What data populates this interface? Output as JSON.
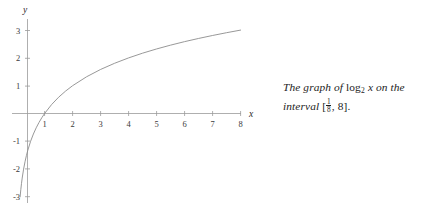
{
  "chart_data": {
    "type": "line",
    "title": "",
    "xlabel": "x",
    "ylabel": "y",
    "function": "log2(x)",
    "xlim": [
      0,
      8.35
    ],
    "ylim": [
      -3.15,
      3.15
    ],
    "grid": false,
    "legend": null,
    "xticks": [
      1,
      2,
      3,
      4,
      5,
      6,
      7,
      8
    ],
    "xtick_labels": [
      "1",
      "2",
      "3",
      "4",
      "5",
      "6",
      "7",
      "8"
    ],
    "yticks": [
      -3,
      -2,
      -1,
      1,
      2,
      3
    ],
    "ytick_labels": [
      "-3",
      "-2",
      "-1",
      "1",
      "2",
      "3"
    ],
    "x": [
      0.125,
      0.15,
      0.175,
      0.2,
      0.25,
      0.3,
      0.35,
      0.4,
      0.5,
      0.6,
      0.7,
      0.8,
      0.9,
      1,
      1.25,
      1.5,
      1.75,
      2,
      2.5,
      3,
      3.5,
      4,
      4.5,
      5,
      5.5,
      6,
      6.5,
      7,
      7.5,
      8
    ],
    "y": [
      -3,
      -2.737,
      -2.515,
      -2.322,
      -2,
      -1.737,
      -1.515,
      -1.322,
      -1,
      -0.737,
      -0.515,
      -0.322,
      -0.152,
      0,
      0.322,
      0.585,
      0.807,
      1,
      1.322,
      1.585,
      1.807,
      2,
      2.17,
      2.322,
      2.459,
      2.585,
      2.7,
      2.807,
      2.907,
      3
    ],
    "series": [
      {
        "name": "log2(x)",
        "color": "#8c8c8c"
      }
    ],
    "domain_interval": "[1/8, 8]"
  },
  "axes": {
    "x_axis_label": "x",
    "y_axis_label": "y"
  },
  "caption": {
    "line1_part1": "The graph of ",
    "log_name": "log",
    "log_base": "2",
    "log_arg": "x",
    "line1_part2": " on the",
    "line2_word": "interval",
    "bracket_open": "[",
    "fraction_num": "1",
    "fraction_den": "8",
    "comma": ", ",
    "upper_bound": "8",
    "bracket_close": "].",
    "full_text": "The graph of log2 x on the interval [1/8, 8]."
  }
}
